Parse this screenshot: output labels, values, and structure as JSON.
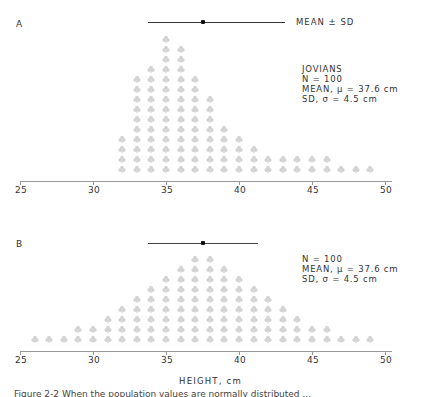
{
  "panels": {
    "a": {
      "letter": "A",
      "legend_label": "MEAN ± SD",
      "stats": [
        "JOVIANS",
        "N = 100",
        "MEAN, μ = 37.6 cm",
        "SD, σ = 4.5 cm"
      ]
    },
    "b": {
      "letter": "B",
      "stats": [
        "N = 100",
        "MEAN, μ = 37.6 cm",
        "SD, σ = 4.5 cm"
      ]
    }
  },
  "xlabel": "HEIGHT, cm",
  "caption": "Figure 2-2  When the population values are normally distributed ...",
  "colors": {
    "dot": "#d4d4d4",
    "axis": "#999999",
    "mean_line": "#333333"
  },
  "chart_data": [
    {
      "type": "bar",
      "subtype": "dot-histogram",
      "title": "A",
      "annotation": [
        "JOVIANS",
        "N = 100",
        "MEAN, μ = 37.6 cm",
        "SD, σ = 4.5 cm"
      ],
      "legend": [
        "MEAN ± SD"
      ],
      "xlabel": "HEIGHT, cm",
      "ylabel": "",
      "xlim": [
        25,
        52
      ],
      "xticks": [
        25,
        30,
        35,
        40,
        45,
        50
      ],
      "grid": false,
      "mean": 37.6,
      "sd": 4.5,
      "mean_sd_bar": [
        33.8,
        41.1
      ],
      "categories": [
        32,
        33,
        34,
        35,
        36,
        37,
        38,
        39,
        40,
        41,
        42,
        43,
        44,
        45,
        46,
        47,
        48,
        49
      ],
      "values": [
        4,
        10,
        11,
        14,
        13,
        10,
        8,
        5,
        4,
        3,
        2,
        2,
        2,
        2,
        2,
        1,
        1,
        1
      ]
    },
    {
      "type": "bar",
      "subtype": "dot-histogram",
      "title": "B",
      "annotation": [
        "N = 100",
        "MEAN, μ = 37.6 cm",
        "SD, σ = 4.5 cm"
      ],
      "xlabel": "HEIGHT, cm",
      "ylabel": "",
      "xlim": [
        25,
        52
      ],
      "xticks": [
        25,
        30,
        35,
        40,
        45,
        50
      ],
      "grid": false,
      "mean": 37.6,
      "sd": 4.5,
      "mean_sd_bar": [
        33.8,
        41.3
      ],
      "categories": [
        26,
        27,
        28,
        29,
        30,
        31,
        32,
        33,
        34,
        35,
        36,
        37,
        38,
        39,
        40,
        41,
        42,
        43,
        44,
        45,
        46,
        47,
        48,
        49
      ],
      "values": [
        1,
        1,
        1,
        2,
        2,
        3,
        4,
        5,
        6,
        7,
        8,
        9,
        9,
        8,
        7,
        6,
        5,
        4,
        3,
        2,
        2,
        1,
        1,
        1
      ]
    }
  ]
}
